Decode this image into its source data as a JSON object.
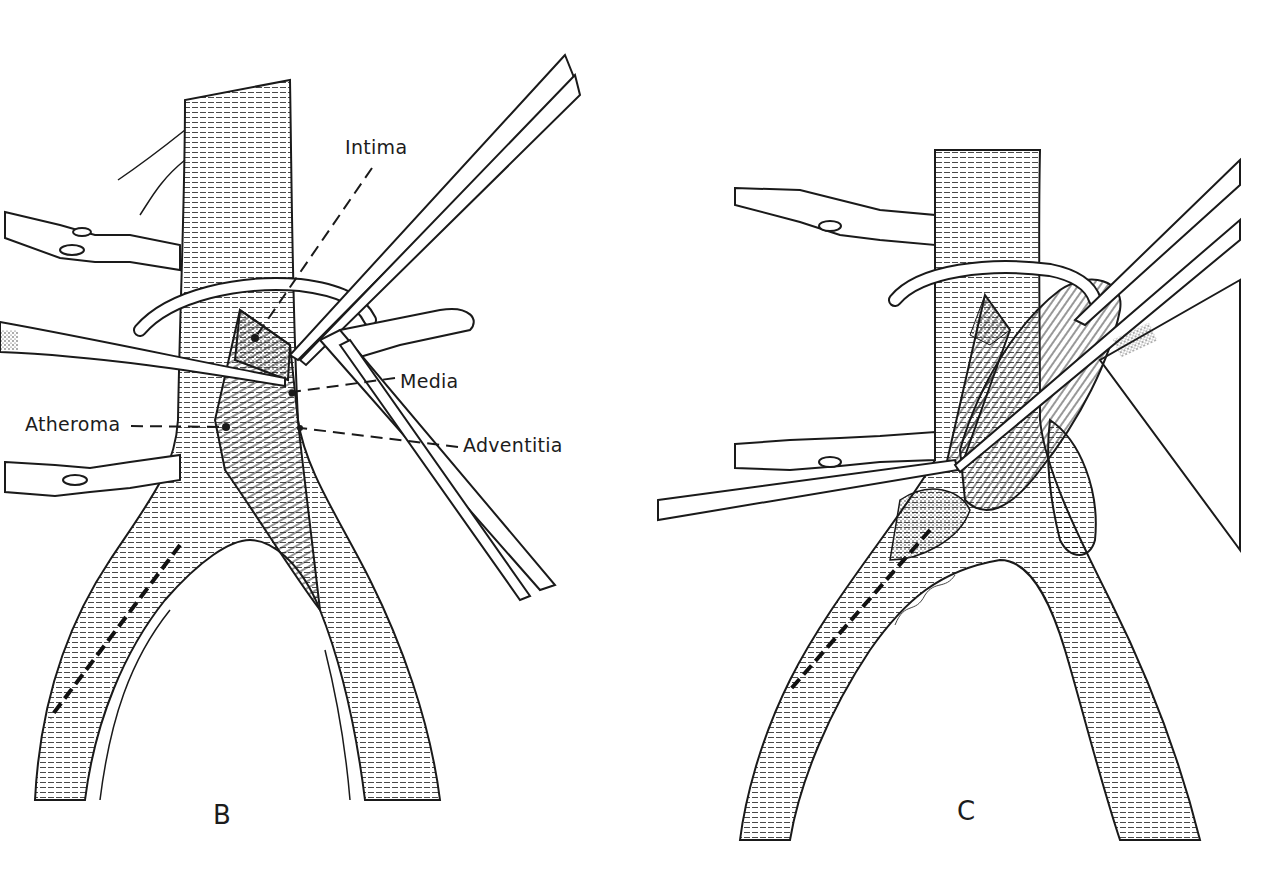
{
  "figure": {
    "panels": [
      {
        "id": "B",
        "letter": "B",
        "labels": {
          "intima": "Intima",
          "media": "Media",
          "atheroma": "Atheroma",
          "adventitia": "Adventitia"
        }
      },
      {
        "id": "C",
        "letter": "C",
        "labels": {}
      }
    ],
    "colors": {
      "ink": "#1a1a1a",
      "paper": "#ffffff"
    }
  }
}
